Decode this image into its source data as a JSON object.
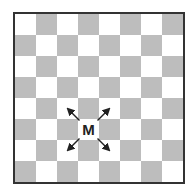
{
  "board": {
    "rows": 8,
    "cols": 8,
    "top_left_color": "light",
    "colors": {
      "light": "#ffffff",
      "dark": "#bdbdbd",
      "border": "#333333"
    }
  },
  "piece": {
    "label": "M",
    "row": 5,
    "col": 3
  },
  "arrows": [
    {
      "direction": "up-left"
    },
    {
      "direction": "up-right"
    },
    {
      "direction": "down-left"
    },
    {
      "direction": "down-right"
    }
  ]
}
